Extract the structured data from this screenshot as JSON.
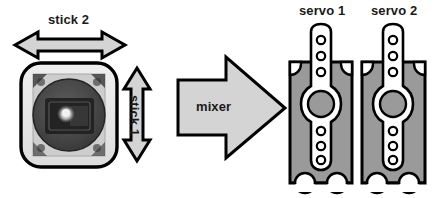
{
  "diagram": {
    "labels": {
      "stick2": "stick 2",
      "stick1": "stick 1",
      "mixer": "mixer",
      "servo1": "servo 1",
      "servo2": "servo 2"
    },
    "colors": {
      "background": "#ffffff",
      "outline": "#000000",
      "arrow_fill": "#d4d4d4",
      "servo_body": "#9a9a9a",
      "servo_horn": "#ffffff",
      "horn_hub": "#9a9a9a",
      "joystick_case": "#e8e8e8",
      "joystick_plate": "#cfcfcf",
      "joystick_disc": "#4a4a4a",
      "joystick_inner": "#2a2a2a",
      "text": "#1a1a1a"
    },
    "elements": {
      "joystick": {
        "name": "joystick module photo",
        "axes": [
          "stick 1",
          "stick 2"
        ]
      },
      "stick2_arrow": {
        "name": "horizontal double-headed arrow",
        "direction": "horizontal",
        "heads": 2
      },
      "stick1_arrow": {
        "name": "vertical double-headed arrow",
        "direction": "vertical",
        "heads": 2
      },
      "mixer_arrow": {
        "name": "block arrow pointing right",
        "direction": "right",
        "heads": 1
      },
      "servos": [
        {
          "label": "servo 1",
          "horn_holes_top": 3,
          "horn_holes_bottom": 3,
          "mount_notches": 2
        },
        {
          "label": "servo 2",
          "horn_holes_top": 3,
          "horn_holes_bottom": 3,
          "mount_notches": 2
        }
      ]
    }
  }
}
